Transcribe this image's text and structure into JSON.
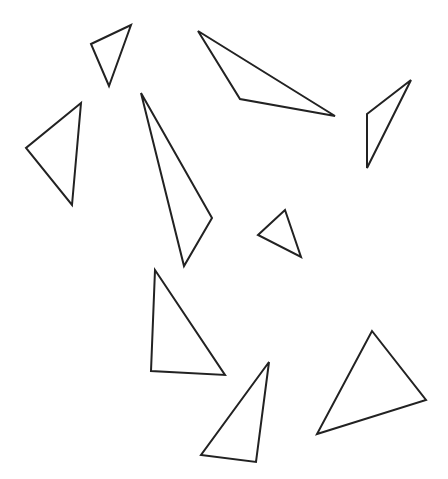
{
  "canvas": {
    "width": 448,
    "height": 479,
    "background": "#ffffff",
    "stroke": "#222222"
  },
  "triangles": [
    {
      "id": "t1",
      "points": "91,44 131,25 109,86"
    },
    {
      "id": "t2",
      "points": "81,103 26,148 72,205"
    },
    {
      "id": "t3",
      "points": "141,93 212,218 184,266"
    },
    {
      "id": "t4",
      "points": "198,31 240,99 335,116"
    },
    {
      "id": "t5",
      "points": "367,114 411,80 367,168"
    },
    {
      "id": "t6",
      "points": "258,235 285,210 301,257"
    },
    {
      "id": "t7",
      "points": "155,270 151,371 225,375"
    },
    {
      "id": "t8",
      "points": "269,362 256,462 201,455"
    },
    {
      "id": "t9",
      "points": "372,331 426,400 317,434"
    }
  ]
}
